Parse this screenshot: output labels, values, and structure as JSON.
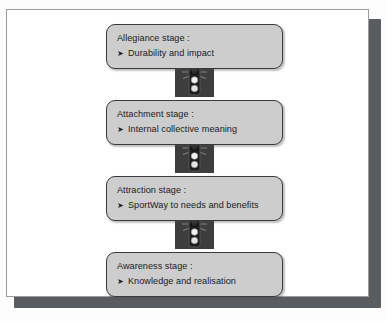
{
  "document": {
    "type": "scanned-figure",
    "background_color": "#fdfdfd",
    "page_color": "#ffffff",
    "page_border_color": "#9a9ea0",
    "shadow_color": "#595d60"
  },
  "diagram": {
    "name": "escalator-of-stages",
    "orientation": "vertical-bottom-to-top",
    "box_fill_color": "#cdcdcd",
    "box_border_color": "#3a3a3a",
    "connector_color": "#3d3d3d",
    "bullet_glyph": "➤",
    "stages": [
      {
        "title": "Allegiance stage :",
        "bullet": "➤",
        "detail": "Durability and impact"
      },
      {
        "title": "Attachment stage :",
        "bullet": "➤",
        "detail": "Internal collective meaning"
      },
      {
        "title": "Attraction stage :",
        "bullet": "➤",
        "detail": "SportWay to needs and benefits"
      },
      {
        "title": "Awareness stage :",
        "bullet": "➤",
        "detail": "Knowledge and realisation"
      }
    ],
    "connectors": [
      {
        "icon": "traffic-light-icon",
        "lamps": [
          "red-lit",
          "white",
          "white"
        ],
        "between": [
          "Allegiance stage :",
          "Attachment stage :"
        ]
      },
      {
        "icon": "traffic-light-icon",
        "lamps": [
          "red-lit",
          "white",
          "white"
        ],
        "between": [
          "Attachment stage :",
          "Attraction stage :"
        ]
      },
      {
        "icon": "traffic-light-icon",
        "lamps": [
          "red-lit",
          "white",
          "white"
        ],
        "between": [
          "Attraction stage :",
          "Awareness stage :"
        ]
      }
    ]
  }
}
